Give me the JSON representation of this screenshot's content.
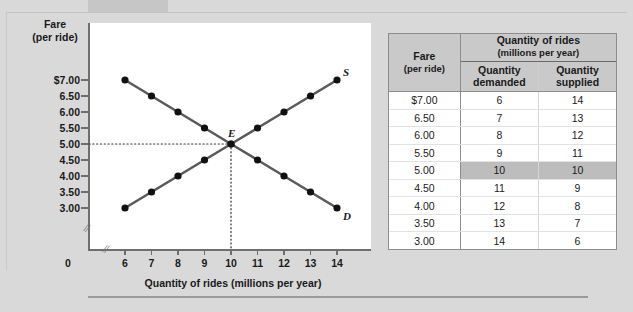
{
  "chart_data": {
    "type": "line",
    "title": "",
    "xlabel": "Quantity of rides (millions per year)",
    "ylabel_line1": "Fare",
    "ylabel_line2": "(per ride)",
    "x": [
      6,
      7,
      8,
      9,
      10,
      11,
      12,
      13,
      14
    ],
    "xticklabels": [
      "6",
      "7",
      "8",
      "9",
      "10",
      "11",
      "12",
      "13",
      "14"
    ],
    "yticklabels": [
      "$7.00",
      "6.50",
      "6.00",
      "5.50",
      "5.00",
      "4.50",
      "4.00",
      "3.50",
      "3.00"
    ],
    "yticks": [
      7.0,
      6.5,
      6.0,
      5.5,
      5.0,
      4.5,
      4.0,
      3.5,
      3.0
    ],
    "xlim": [
      6,
      14
    ],
    "ylim": [
      3.0,
      7.0
    ],
    "origin_label": "0",
    "grid": false,
    "axis_break_x": true,
    "axis_break_y": true,
    "legend": "none",
    "series": [
      {
        "name": "Demand",
        "label": "D",
        "points": [
          {
            "q": 6,
            "p": 7.0
          },
          {
            "q": 7,
            "p": 6.5
          },
          {
            "q": 8,
            "p": 6.0
          },
          {
            "q": 9,
            "p": 5.5
          },
          {
            "q": 10,
            "p": 5.0
          },
          {
            "q": 11,
            "p": 4.5
          },
          {
            "q": 12,
            "p": 4.0
          },
          {
            "q": 13,
            "p": 3.5
          },
          {
            "q": 14,
            "p": 3.0
          }
        ]
      },
      {
        "name": "Supply",
        "label": "S",
        "points": [
          {
            "q": 6,
            "p": 3.0
          },
          {
            "q": 7,
            "p": 3.5
          },
          {
            "q": 8,
            "p": 4.0
          },
          {
            "q": 9,
            "p": 4.5
          },
          {
            "q": 10,
            "p": 5.0
          },
          {
            "q": 11,
            "p": 5.5
          },
          {
            "q": 12,
            "p": 6.0
          },
          {
            "q": 13,
            "p": 6.5
          },
          {
            "q": 14,
            "p": 7.0
          }
        ]
      }
    ],
    "annotations": [
      {
        "name": "equilibrium",
        "label": "E",
        "q": 10,
        "p": 5.0,
        "guide_horizontal": true,
        "guide_vertical": true
      }
    ]
  },
  "table": {
    "group_header_line1": "Quantity of rides",
    "group_header_line2": "(millions per year)",
    "col_fare_line1": "Fare",
    "col_fare_line2": "(per ride)",
    "col_demanded_line1": "Quantity",
    "col_demanded_line2": "demanded",
    "col_supplied_line1": "Quantity",
    "col_supplied_line2": "supplied",
    "highlight_row_index": 4,
    "rows": [
      {
        "fare": "$7.00",
        "demanded": "6",
        "supplied": "14"
      },
      {
        "fare": "6.50",
        "demanded": "7",
        "supplied": "13"
      },
      {
        "fare": "6.00",
        "demanded": "8",
        "supplied": "12"
      },
      {
        "fare": "5.50",
        "demanded": "9",
        "supplied": "11"
      },
      {
        "fare": "5.00",
        "demanded": "10",
        "supplied": "10"
      },
      {
        "fare": "4.50",
        "demanded": "11",
        "supplied": "9"
      },
      {
        "fare": "4.00",
        "demanded": "12",
        "supplied": "8"
      },
      {
        "fare": "3.50",
        "demanded": "13",
        "supplied": "7"
      },
      {
        "fare": "3.00",
        "demanded": "14",
        "supplied": "6"
      }
    ]
  },
  "colors": {
    "background": "#d9d9d9",
    "plot_background": "#ffffff",
    "curve": "#5a5a5a",
    "point": "#111111",
    "axis": "#6e6e6e",
    "table_header": "#c9c9c9",
    "highlight": "#bdbdbd"
  }
}
